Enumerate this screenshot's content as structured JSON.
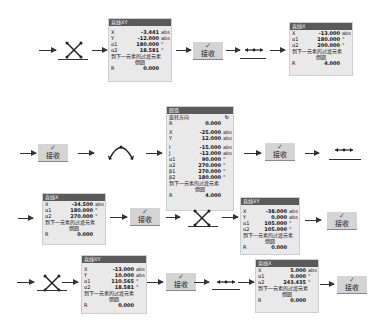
{
  "accept_label": "接收",
  "panels": {
    "p1": {
      "title": "直线XY",
      "rows": [
        {
          "k": "X",
          "v": "-3.441",
          "u": "abs"
        },
        {
          "k": "Y",
          "v": "-12.000",
          "u": "abs"
        },
        {
          "k": "α1",
          "v": "180.000",
          "u": "°"
        },
        {
          "k": "α2",
          "v": "18.581",
          "u": "°"
        }
      ],
      "note": "到下一元素的过渡元素",
      "note2": "倒圆",
      "r_label": "R",
      "r_value": "0.000"
    },
    "p2": {
      "title": "直线X",
      "rows": [
        {
          "k": "X",
          "v": "-13.000",
          "u": "abs"
        },
        {
          "k": "α1",
          "v": "180.000",
          "u": "°"
        },
        {
          "k": "α2",
          "v": "200.000",
          "u": "°"
        }
      ],
      "note": "到下一元素的过渡元素",
      "note2": "倒圆",
      "r_label": "R",
      "r_value": "4.000"
    },
    "p3": {
      "title": "圆弧",
      "rot": "旋转方向",
      "rows_a": [
        {
          "k": "R",
          "v": "0.000",
          "u": ""
        }
      ],
      "rows_b": [
        {
          "k": "X",
          "v": "-25.000",
          "u": "abs"
        },
        {
          "k": "Y",
          "v": "12.000",
          "u": "abs"
        }
      ],
      "rows_c": [
        {
          "k": "I",
          "v": "-15.000",
          "u": "abs"
        },
        {
          "k": "J",
          "v": "-12.000",
          "u": "abs"
        },
        {
          "k": "α1",
          "v": "90.000",
          "u": "°"
        },
        {
          "k": "α2",
          "v": "270.000",
          "u": "°"
        },
        {
          "k": "β1",
          "v": "270.000",
          "u": "°"
        },
        {
          "k": "β2",
          "v": "180.000",
          "u": "°"
        }
      ],
      "note": "到下一元素的过渡元素",
      "note2": "倒圆",
      "r_label": "R",
      "r_value": "4.000"
    },
    "p4": {
      "title": "直线X",
      "rows": [
        {
          "k": "X",
          "v": "-34.500",
          "u": "abs"
        },
        {
          "k": "α1",
          "v": "180.000",
          "u": "°"
        },
        {
          "k": "α2",
          "v": "270.000",
          "u": "°"
        }
      ],
      "note": "到下一元素的过渡元素",
      "note2": "倒圆",
      "r_label": "R",
      "r_value": "0.000"
    },
    "p5": {
      "title": "直线XY",
      "rows": [
        {
          "k": "X",
          "v": "-38.000",
          "u": "abs"
        },
        {
          "k": "Y",
          "v": "0.000",
          "u": "abs"
        },
        {
          "k": "α1",
          "v": "105.000",
          "u": "°"
        },
        {
          "k": "α2",
          "v": "105.000",
          "u": "°"
        }
      ],
      "note": "到下一元素的过渡元素",
      "note2": "倒圆",
      "r_label": "R",
      "r_value": "0.000"
    },
    "p6": {
      "title": "直线XY",
      "rows": [
        {
          "k": "X",
          "v": "-13.000",
          "u": "abs"
        },
        {
          "k": "Y",
          "v": "10.000",
          "u": "abs"
        },
        {
          "k": "α1",
          "v": "110.565",
          "u": "°"
        },
        {
          "k": "α2",
          "v": "18.581",
          "u": "°"
        }
      ],
      "note": "到下一元素的过渡元素",
      "note2": "倒圆",
      "r_label": "R",
      "r_value": "0.000"
    },
    "p7": {
      "title": "直线X",
      "rows": [
        {
          "k": "X",
          "v": "5.000",
          "u": "abs"
        },
        {
          "k": "α1",
          "v": "0.000",
          "u": "°"
        },
        {
          "k": "α2",
          "v": "243.435",
          "u": "°"
        }
      ],
      "note": "到下一元素的过渡元素",
      "note2": "倒圆",
      "r_label": "R",
      "r_value": "0.000"
    }
  }
}
